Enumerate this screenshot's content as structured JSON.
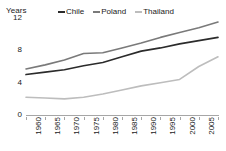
{
  "chart_data": {
    "type": "line",
    "title": "",
    "xlabel": "",
    "ylabel": "Years",
    "ylim": [
      0,
      12
    ],
    "yticks": [
      0,
      4,
      8,
      12
    ],
    "grid": false,
    "legend_position": "top",
    "categories": [
      "1960",
      "1965",
      "1970",
      "1975",
      "1980",
      "1985",
      "1990",
      "1995",
      "2000",
      "2005",
      "2010"
    ],
    "x": [
      1960,
      1965,
      1970,
      1975,
      1980,
      1985,
      1990,
      1995,
      2000,
      2005,
      2010
    ],
    "series": [
      {
        "name": "Chile",
        "color": "#2b2b2b",
        "values": [
          5.0,
          5.3,
          5.6,
          6.1,
          6.5,
          7.2,
          7.9,
          8.3,
          8.8,
          9.2,
          9.6
        ]
      },
      {
        "name": "Poland",
        "color": "#7a7a7a",
        "values": [
          5.7,
          6.2,
          6.8,
          7.6,
          7.7,
          8.3,
          8.9,
          9.6,
          10.2,
          10.8,
          11.5
        ]
      },
      {
        "name": "Thailand",
        "color": "#bdbdbd",
        "values": [
          2.2,
          2.1,
          2.0,
          2.2,
          2.6,
          3.1,
          3.6,
          4.0,
          4.4,
          6.0,
          7.2
        ]
      }
    ]
  },
  "axis": {
    "y_title": "Years",
    "y_tick_labels": [
      "12",
      "8",
      "4",
      "0"
    ],
    "x_tick_labels": [
      "1960",
      "1965",
      "1970",
      "1975",
      "1980",
      "1985",
      "1990",
      "1995",
      "2000",
      "2005",
      "2010"
    ]
  },
  "legend": {
    "items": [
      {
        "label": "Chile",
        "color": "#2b2b2b"
      },
      {
        "label": "Poland",
        "color": "#7a7a7a"
      },
      {
        "label": "Thailand",
        "color": "#bdbdbd"
      }
    ]
  },
  "colors": {
    "axis": "#a6a6a6",
    "text": "#1a1a1a",
    "background": "#ffffff"
  }
}
